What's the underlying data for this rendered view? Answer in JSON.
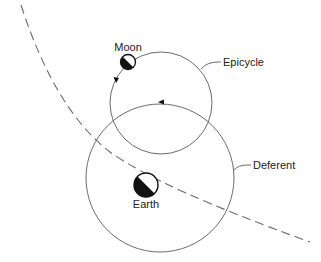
{
  "diagram": {
    "type": "epicycle-model",
    "labels": {
      "moon": "Moon",
      "epicycle": "Epicycle",
      "deferent": "Deferent",
      "earth": "Earth"
    },
    "colors": {
      "line": "#6b6b6b",
      "fill_dark": "#111111",
      "background": "#ffffff"
    }
  }
}
